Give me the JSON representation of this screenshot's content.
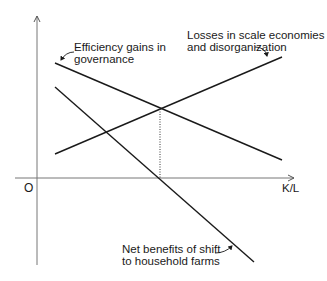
{
  "diagram": {
    "origin_label": "O",
    "x_axis_label": "K/L",
    "curves": [
      {
        "name": "efficiency",
        "label_line1": "Efficiency gains in",
        "label_line2": "governance"
      },
      {
        "name": "losses",
        "label_line1": "Losses in scale economies",
        "label_line2": "and disorganization"
      },
      {
        "name": "net",
        "label_line1": "Net benefits of shift",
        "label_line2": "to household farms"
      }
    ]
  }
}
